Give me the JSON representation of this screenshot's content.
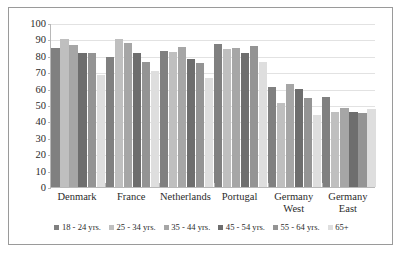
{
  "chart_data": {
    "type": "bar",
    "title": "",
    "subtitle": "",
    "xlabel": "",
    "ylabel": "",
    "ylim": [
      0,
      100
    ],
    "ytick_step": 10,
    "yticks": [
      0,
      10,
      20,
      30,
      40,
      50,
      60,
      70,
      80,
      90,
      100
    ],
    "grid": true,
    "legend_position": "bottom",
    "categories": [
      "Denmark",
      "France",
      "Netherlands",
      "Portugal",
      "Germany\nWest",
      "Germany\nEast"
    ],
    "series": [
      {
        "name": "18 - 24 yrs.",
        "color": "#808080",
        "values": [
          84.5,
          79.5,
          83,
          87.5,
          61,
          55
        ]
      },
      {
        "name": "25 - 34 yrs.",
        "color": "#bfbfbf",
        "values": [
          90,
          90,
          82.5,
          84,
          51,
          46
        ]
      },
      {
        "name": "35 - 44 yrs.",
        "color": "#a6a6a6",
        "values": [
          86.5,
          88,
          85.5,
          85,
          63,
          48
        ]
      },
      {
        "name": "45 - 54 yrs.",
        "color": "#6e6e6e",
        "values": [
          81.5,
          82,
          78,
          82,
          60,
          46
        ]
      },
      {
        "name": "55 - 64 yrs.",
        "color": "#949494",
        "values": [
          81.5,
          76.5,
          75.5,
          86,
          54,
          45
        ]
      },
      {
        "name": "65+",
        "color": "#dedede",
        "values": [
          68.5,
          70.5,
          66.5,
          76,
          44,
          47.5
        ]
      }
    ]
  }
}
